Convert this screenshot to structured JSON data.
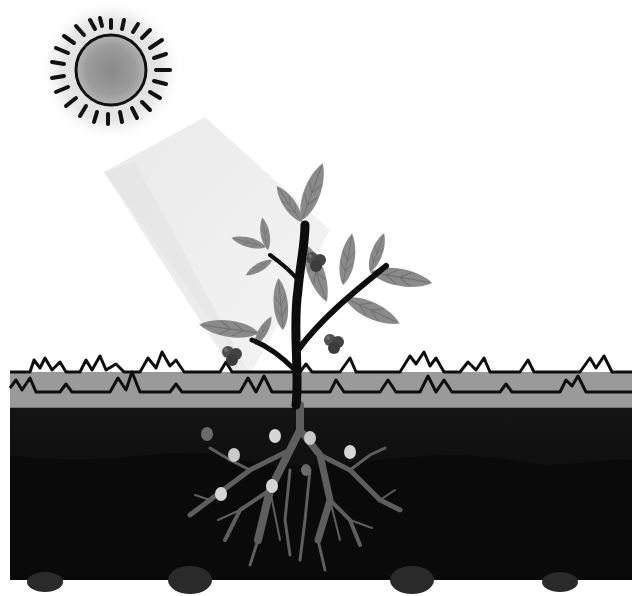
{
  "scene": {
    "title": "Plant photosynthesis illustration",
    "width": 642,
    "height": 596,
    "colors": {
      "background": "#ffffff",
      "sun_halo": "#e2e2e2",
      "sun_disc": "#a9a9a9",
      "sun_core": "#8e8e8e",
      "sun_outline": "#111111",
      "light_beam": "#ececec",
      "light_beam_edge": "#f5f5f5",
      "leaf": "#8a8a8a",
      "leaf_vein": "#6e6e6e",
      "stem": "#0c0c0c",
      "berry": "#4a4a4a",
      "berry_highlight": "#6a6a6a",
      "grass": "#9a9a9a",
      "grass_outline": "#0e0e0e",
      "soil_top": "#1a1a1a",
      "soil_bottom": "#080808",
      "root": "#5e5e5e",
      "nutrient_light": "#d4d4d4",
      "nutrient_dark": "#6a6a6a",
      "stone": "#2e2e2e"
    },
    "elements": {
      "sun": "sun-icon",
      "beam": "sunlight-beam",
      "plant": "plant",
      "grass": "grass-strip",
      "soil": "soil-layer",
      "roots": "root-system",
      "nutrients": "nutrient-dots"
    }
  }
}
